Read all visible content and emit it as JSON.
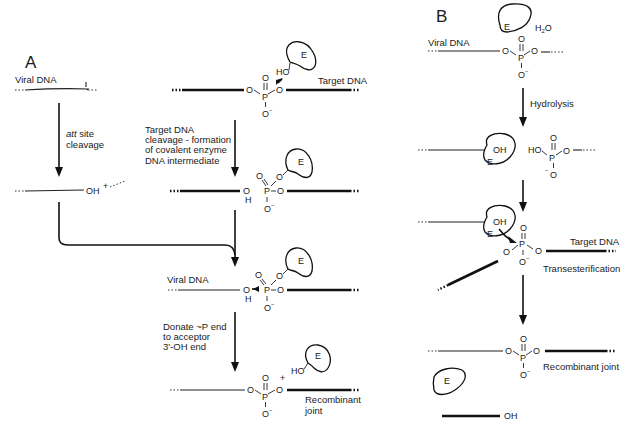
{
  "figure": {
    "panel_a": {
      "label": "A",
      "viral_dna_label": "Viral DNA",
      "target_dna_label": "Target DNA",
      "step1_italic": "att",
      "step1_rest": " site",
      "step1_line2": "cleavage",
      "cleaved_end": "OH",
      "plus": "+",
      "step2_lines": [
        "Target DNA",
        "cleavage - formation",
        "of covalent enzyme",
        "DNA intermediate"
      ],
      "intermediate_viral_label": "Viral DNA",
      "step3_lines": [
        "Donate ~P end",
        "to acceptor",
        "3'-OH end"
      ],
      "product_label_lines": [
        "Recombinant",
        "joint"
      ],
      "enzyme_label": "E",
      "hydroxyl": "HO",
      "oxygen": "O",
      "phosphorus": "P",
      "hydrogen": "H",
      "neg_charge": "−"
    },
    "panel_b": {
      "label": "B",
      "viral_dna_label": "Viral DNA",
      "water": "H",
      "water_sub": "2",
      "water_o": "O",
      "step1": "Hydrolysis",
      "enzyme_label": "E",
      "oh": "OH",
      "ho": "HO",
      "target_dna_label": "Target DNA",
      "step2": "Transesterification",
      "product_label": "Recombinant joint",
      "released_end": "OH",
      "oxygen": "O",
      "phosphorus": "P",
      "neg_charge": "−"
    }
  }
}
